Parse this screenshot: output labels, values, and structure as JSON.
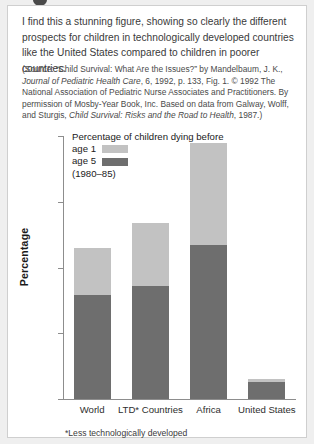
{
  "commentary": "I find this a stunning figure, showing so clearly the different prospects for children in technologically developed countries like the United States compared to children in poorer countries.",
  "source": {
    "open_paren": "(Source:",
    "title_quoted": "“Child Survival: What Are the Issues?” by Mandelbaum, J. K.,",
    "journal": "Journal of Pediatric Health Care",
    "journal_rest": ", 6, 1992, p. 133, Fig. 1. © 1992 The National Association of Pediatric Nurse Associates and Practitioners. By permission of Mosby-Year Book, Inc. Based on data from Galway, Wolff, and Sturgis,",
    "book": "Child Survival: Risks and the Road to Health",
    "book_rest": ", 1987.)"
  },
  "chart_data": {
    "type": "bar",
    "subtype": "stacked",
    "title": "Percentage of children dying before",
    "period": "(1980–85)",
    "xlabel": "",
    "ylabel": "Percentage",
    "ylim": [
      0,
      20
    ],
    "yticks": [
      0,
      5,
      10,
      15,
      20
    ],
    "ytick_labels": [
      "0",
      "5",
      "10",
      "15",
      "20"
    ],
    "grid": false,
    "legend_position": "upper-left-inside",
    "categories": [
      "World",
      "LTD* Countries",
      "Africa",
      "United States"
    ],
    "series": [
      {
        "name": "age 5",
        "label": "age 5",
        "color": "#6e6e6e",
        "values": [
          7.9,
          8.6,
          11.7,
          1.3
        ]
      },
      {
        "name": "age 1",
        "label": "age 1",
        "color": "#c2c2c2",
        "values": [
          3.6,
          4.8,
          7.8,
          0.2
        ]
      }
    ],
    "totals": [
      11.5,
      13.4,
      19.5,
      1.5
    ],
    "footnote": "*Less technologically developed"
  }
}
